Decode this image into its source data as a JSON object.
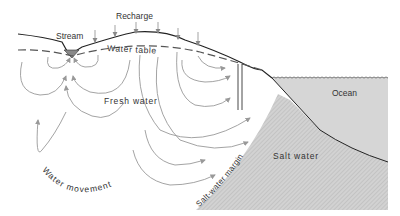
{
  "diagram": {
    "type": "coastal aquifer cross-section",
    "labels": {
      "recharge": "Recharge",
      "stream": "Stream",
      "water_table": "Water table",
      "fresh_water": "Fresh water",
      "ocean": "Ocean",
      "salt_water": "Salt water",
      "salt_water_margin": "Salt-water margin",
      "water_movement": "Water movement"
    },
    "colors": {
      "ocean_fill": "#d6d6d6",
      "salt_water_fill": "#cfcfcf",
      "line": "#222222",
      "flow_arrows": "#999999",
      "text": "#333333"
    }
  }
}
